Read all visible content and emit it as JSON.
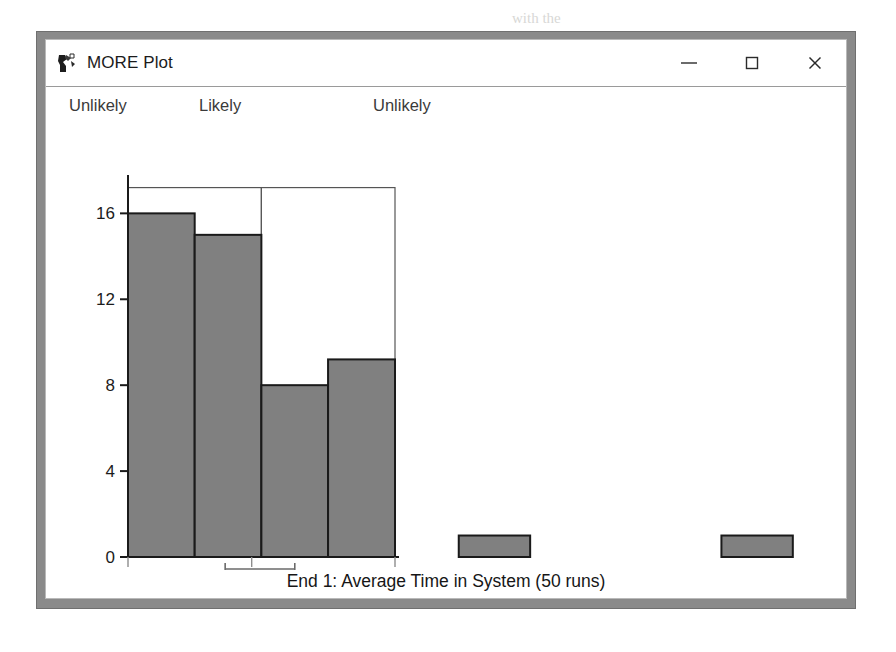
{
  "window": {
    "title": "MORE Plot",
    "icon": "more-plot-app-icon",
    "controls": [
      {
        "name": "minimize",
        "glyph": "minimize-icon"
      },
      {
        "name": "maximize",
        "glyph": "maximize-icon"
      },
      {
        "name": "close",
        "glyph": "close-icon"
      }
    ]
  },
  "regions": [
    {
      "label": "Unlikely"
    },
    {
      "label": "Likely"
    },
    {
      "label": "Unlikely"
    }
  ],
  "caption": "End 1: Average Time in System (50 runs)",
  "colors": {
    "bar_fill": "#808080",
    "bar_stroke": "#1a1a1a",
    "envelope_fill": "#ffffff",
    "envelope_stroke": "#555555",
    "axis": "#1a1a1a",
    "window_frame": "#8a8a8a",
    "title_text": "#1b1b1b"
  },
  "chart_data": {
    "type": "bar",
    "title": "End 1: Average Time in System (50 runs)",
    "xlabel": "",
    "ylabel": "",
    "grid": false,
    "legend": "none",
    "ylim": [
      0,
      17.6
    ],
    "yticks": [
      0,
      4,
      8,
      12,
      16
    ],
    "ytick_labels": [
      "0",
      "4",
      "8",
      "12",
      "16"
    ],
    "xlim": [
      11.03,
      21.5
    ],
    "xticks": [
      11.03,
      15.88,
      21.5
    ],
    "xtick_labels": [
      "11.03",
      "15.88",
      "21.50"
    ],
    "bin_edges": [
      11.03,
      13.645,
      16.26,
      18.875,
      21.5
    ],
    "values": [
      16,
      15,
      8,
      9.2
    ],
    "categories": [
      "11.03-13.65",
      "13.65-16.26",
      "16.26-18.88",
      "18.88-21.50"
    ],
    "envelope": {
      "label": "upper-envelope-outline",
      "segments": [
        {
          "x0": 11.03,
          "x1": 16.26,
          "y": 17.2
        },
        {
          "x0": 16.26,
          "x1": 21.5,
          "y": 17.2
        }
      ]
    },
    "confidence_bracket": {
      "label": "confidence-interval-bracket",
      "x0": 14.84,
      "x1": 17.57,
      "center": 15.88
    },
    "outliers": [
      {
        "label": "outlier-bar-1",
        "x0": 24.0,
        "x1": 26.8,
        "value": 1
      },
      {
        "label": "outlier-bar-2",
        "x0": 34.3,
        "x1": 37.1,
        "value": 1
      }
    ]
  },
  "bleed_text": [
    {
      "text": "with the",
      "x": 512,
      "y": 10
    },
    {
      "text": "the specified",
      "x": 196,
      "y": 126
    },
    {
      "text": "confidence",
      "x": 236,
      "y": 196
    },
    {
      "text": "and the half-width",
      "x": 222,
      "y": 228
    }
  ]
}
